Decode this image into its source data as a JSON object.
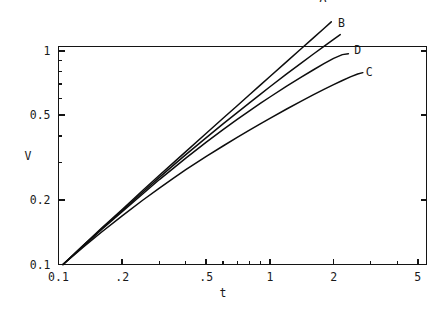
{
  "chart_data": {
    "type": "line",
    "title": "",
    "subtitle": "",
    "xlabel": "t",
    "ylabel": "V",
    "xscale": "log",
    "yscale": "log",
    "xlim": [
      0.1,
      5.5
    ],
    "ylim": [
      0.1,
      1.05
    ],
    "grid": false,
    "legend_position": "inline-end-of-curve",
    "x_tick_labels": [
      "0.1",
      ".2",
      ".5",
      "1",
      "2",
      "5"
    ],
    "x_tick_values": [
      0.1,
      0.2,
      0.5,
      1,
      2,
      5
    ],
    "x_minor_ticks": [
      0.3,
      0.4,
      0.6,
      0.7,
      0.8,
      0.9,
      3,
      4
    ],
    "y_tick_labels": [
      "0.1",
      "0.2",
      "0.5",
      "1"
    ],
    "y_tick_values": [
      0.1,
      0.2,
      0.5,
      1
    ],
    "y_minor_ticks": [
      0.3,
      0.4,
      0.6,
      0.7,
      0.8,
      0.9
    ],
    "series": [
      {
        "name": "A",
        "label": "A",
        "label_x": 1.78,
        "label_y": 1.78,
        "points": [
          [
            0.105,
            0.1
          ],
          [
            0.13,
            0.122
          ],
          [
            0.16,
            0.148
          ],
          [
            0.2,
            0.181
          ],
          [
            0.25,
            0.222
          ],
          [
            0.3,
            0.262
          ],
          [
            0.35,
            0.3
          ],
          [
            0.4,
            0.338
          ],
          [
            0.5,
            0.412
          ],
          [
            0.6,
            0.484
          ],
          [
            0.7,
            0.554
          ],
          [
            0.8,
            0.624
          ],
          [
            0.9,
            0.692
          ],
          [
            1.0,
            0.76
          ],
          [
            1.2,
            0.892
          ],
          [
            1.4,
            1.022
          ],
          [
            1.6,
            1.15
          ],
          [
            1.8,
            1.275
          ],
          [
            1.95,
            1.37
          ]
        ]
      },
      {
        "name": "B",
        "label": "B",
        "label_x": 2.18,
        "label_y": 1.36,
        "points": [
          [
            0.105,
            0.1
          ],
          [
            0.13,
            0.122
          ],
          [
            0.16,
            0.147
          ],
          [
            0.2,
            0.179
          ],
          [
            0.25,
            0.218
          ],
          [
            0.3,
            0.256
          ],
          [
            0.35,
            0.292
          ],
          [
            0.4,
            0.327
          ],
          [
            0.5,
            0.393
          ],
          [
            0.6,
            0.456
          ],
          [
            0.7,
            0.515
          ],
          [
            0.8,
            0.572
          ],
          [
            0.9,
            0.627
          ],
          [
            1.0,
            0.68
          ],
          [
            1.2,
            0.781
          ],
          [
            1.4,
            0.876
          ],
          [
            1.6,
            0.966
          ],
          [
            1.8,
            1.052
          ],
          [
            2.0,
            1.134
          ],
          [
            2.15,
            1.193
          ]
        ]
      },
      {
        "name": "D",
        "label": "D",
        "label_x": 2.6,
        "label_y": 1.01,
        "points": [
          [
            0.105,
            0.1
          ],
          [
            0.13,
            0.121
          ],
          [
            0.16,
            0.146
          ],
          [
            0.2,
            0.177
          ],
          [
            0.25,
            0.214
          ],
          [
            0.3,
            0.25
          ],
          [
            0.35,
            0.283
          ],
          [
            0.4,
            0.315
          ],
          [
            0.5,
            0.374
          ],
          [
            0.6,
            0.428
          ],
          [
            0.7,
            0.478
          ],
          [
            0.8,
            0.524
          ],
          [
            0.9,
            0.568
          ],
          [
            1.0,
            0.609
          ],
          [
            1.2,
            0.685
          ],
          [
            1.4,
            0.753
          ],
          [
            1.6,
            0.815
          ],
          [
            1.8,
            0.872
          ],
          [
            2.0,
            0.924
          ],
          [
            2.2,
            0.962
          ],
          [
            2.35,
            0.972
          ]
        ]
      },
      {
        "name": "C",
        "label": "C",
        "label_x": 2.95,
        "label_y": 0.795,
        "points": [
          [
            0.105,
            0.1
          ],
          [
            0.13,
            0.12
          ],
          [
            0.16,
            0.142
          ],
          [
            0.2,
            0.169
          ],
          [
            0.25,
            0.2
          ],
          [
            0.3,
            0.228
          ],
          [
            0.35,
            0.254
          ],
          [
            0.4,
            0.278
          ],
          [
            0.5,
            0.321
          ],
          [
            0.6,
            0.359
          ],
          [
            0.7,
            0.394
          ],
          [
            0.8,
            0.426
          ],
          [
            0.9,
            0.456
          ],
          [
            1.0,
            0.484
          ],
          [
            1.2,
            0.535
          ],
          [
            1.4,
            0.581
          ],
          [
            1.6,
            0.623
          ],
          [
            1.8,
            0.661
          ],
          [
            2.0,
            0.696
          ],
          [
            2.2,
            0.728
          ],
          [
            2.4,
            0.757
          ],
          [
            2.6,
            0.781
          ],
          [
            2.75,
            0.792
          ]
        ]
      }
    ]
  },
  "axes": {
    "x_axis_title": "t",
    "y_axis_title": "V"
  }
}
